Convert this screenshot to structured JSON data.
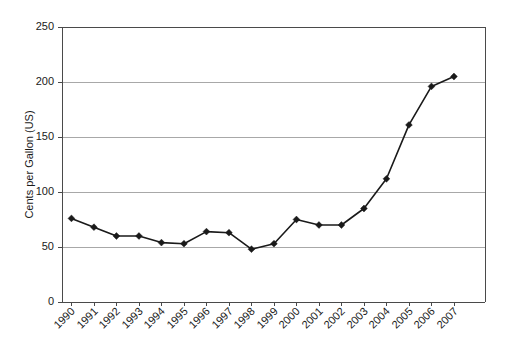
{
  "chart_data": {
    "type": "line",
    "title": "",
    "subtitle": "",
    "xlabel": "",
    "ylabel": "Cents per Gallon (US)",
    "categories": [
      "1990",
      "1991",
      "1992",
      "1993",
      "1994",
      "1995",
      "1996",
      "1997",
      "1998",
      "1999",
      "2000",
      "2001",
      "2002",
      "2003",
      "2004",
      "2005",
      "2006",
      "2007"
    ],
    "values": [
      76,
      68,
      60,
      60,
      54,
      53,
      64,
      63,
      48,
      53,
      75,
      70,
      70,
      85,
      112,
      161,
      196,
      205
    ],
    "series": [
      {
        "name": "Cents per Gallon (US)",
        "values": [
          76,
          68,
          60,
          60,
          54,
          53,
          64,
          63,
          48,
          53,
          75,
          70,
          70,
          85,
          112,
          161,
          196,
          205
        ]
      }
    ],
    "ylim": [
      0,
      250
    ],
    "yticks": [
      0,
      50,
      100,
      150,
      200,
      250
    ],
    "ytick_labels": [
      "0",
      "50",
      "100",
      "150",
      "200",
      "250"
    ],
    "grid": true,
    "grid_axis": "y",
    "legend": false,
    "legend_position": "none",
    "marker": "diamond",
    "line_color": "#1a1a1a",
    "marker_color": "#1a1a1a",
    "grid_color": "#a8a8a8",
    "axis_color": "#4a4a4a",
    "background_color": "#ffffff",
    "xtick_rotation": -45,
    "annotations": []
  }
}
